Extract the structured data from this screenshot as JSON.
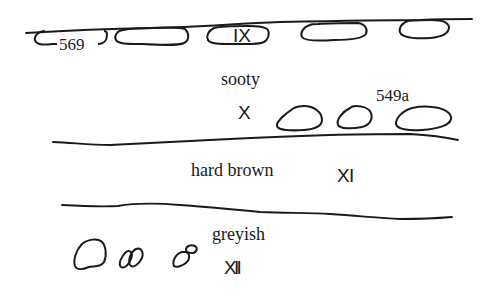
{
  "figure": {
    "type": "stratigraphic-section",
    "layers": [
      {
        "id": "IX",
        "label": "",
        "roman": "IX",
        "context": "569"
      },
      {
        "id": "X",
        "label": "sooty",
        "roman": "X",
        "context": "549a"
      },
      {
        "id": "XI",
        "label": "hard brown",
        "roman": "XI"
      },
      {
        "id": "XII",
        "label": "greyish",
        "roman": "XII"
      }
    ],
    "annotations": {
      "context_569": "569",
      "context_549a": "549a",
      "layer_ix": "IX",
      "layer_x_label": "sooty",
      "layer_x": "X",
      "layer_xi_label": "hard brown",
      "layer_xi": "X I",
      "layer_xii_label": "greyish",
      "layer_xii": "X I I"
    },
    "stroke_color": "#1a1a1a",
    "background": "#ffffff"
  }
}
